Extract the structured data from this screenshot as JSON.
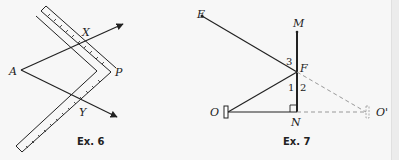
{
  "figures": [
    {
      "caption": "Ex. 6",
      "labels": {
        "A": "A",
        "X": "X",
        "P": "P",
        "Y": "Y"
      }
    },
    {
      "caption": "Ex. 7",
      "labels": {
        "E": "E",
        "M": "M",
        "F": "F",
        "O": "O",
        "N": "N",
        "O_prime": "O'"
      },
      "angle_labels": {
        "a1": "1",
        "a2": "2",
        "a3": "3"
      }
    }
  ],
  "colors": {
    "ink": "#222222",
    "dashed": "#999999",
    "background": "#f7f7f7"
  }
}
